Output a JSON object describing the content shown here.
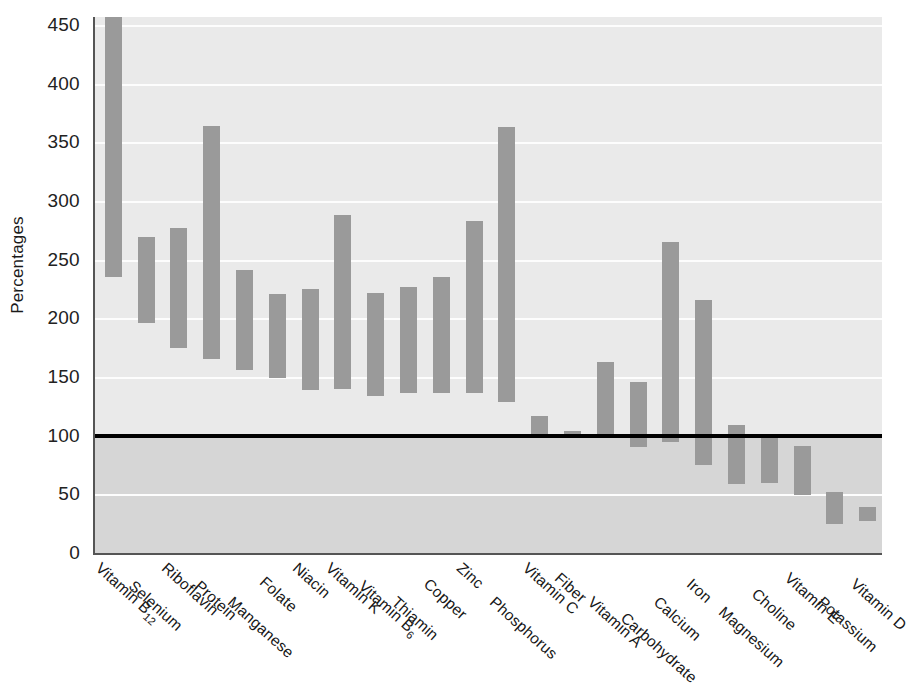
{
  "chart_data": {
    "type": "bar",
    "subtype": "floating-range-bar",
    "title": "",
    "xlabel": "",
    "ylabel": "Percentages",
    "ylim": [
      0,
      450
    ],
    "ytick_step": 50,
    "yticks": [
      0,
      50,
      100,
      150,
      200,
      250,
      300,
      350,
      400,
      450
    ],
    "ytick_labels": [
      "0",
      "50",
      "100",
      "150",
      "200",
      "250",
      "300",
      "350",
      "400",
      "450"
    ],
    "grid": true,
    "legend": "none",
    "reference_line": {
      "value": 100,
      "label": "100%",
      "color": "#000000"
    },
    "bar_color": "#9a9a9a",
    "plot_background": "#eaeaea",
    "lower_band_background": "#d6d6d6",
    "categories": [
      "Vitamin B12",
      "Selenium",
      "Riboflavin",
      "Protein",
      "Manganese",
      "Folate",
      "Niacin",
      "Vitamin K",
      "Vitamin B6",
      "Thiamin",
      "Copper",
      "Zinc",
      "Phosphorus",
      "Vitamin C",
      "Fiber",
      "Vitamin A",
      "Carbohydrate",
      "Calcium",
      "Iron",
      "Magnesium",
      "Choline",
      "Vitamin E",
      "Potassium",
      "Vitamin D"
    ],
    "category_labels": [
      {
        "base": "Vitamin B",
        "sub": "12"
      },
      {
        "base": "Selenium",
        "sub": ""
      },
      {
        "base": "Riboflavin",
        "sub": ""
      },
      {
        "base": "Protein",
        "sub": ""
      },
      {
        "base": "Manganese",
        "sub": ""
      },
      {
        "base": "Folate",
        "sub": ""
      },
      {
        "base": "Niacin",
        "sub": ""
      },
      {
        "base": "Vitamin K",
        "sub": ""
      },
      {
        "base": "Vitamin B",
        "sub": "6"
      },
      {
        "base": "Thiamin",
        "sub": ""
      },
      {
        "base": "Copper",
        "sub": ""
      },
      {
        "base": "Zinc",
        "sub": ""
      },
      {
        "base": "Phosphorus",
        "sub": ""
      },
      {
        "base": "Vitamin C",
        "sub": ""
      },
      {
        "base": "Fiber",
        "sub": ""
      },
      {
        "base": "Vitamin A",
        "sub": ""
      },
      {
        "base": "Carbohydrate",
        "sub": ""
      },
      {
        "base": "Calcium",
        "sub": ""
      },
      {
        "base": "Iron",
        "sub": ""
      },
      {
        "base": "Magnesium",
        "sub": ""
      },
      {
        "base": "Choline",
        "sub": ""
      },
      {
        "base": "Vitamin E",
        "sub": ""
      },
      {
        "base": "Potassium",
        "sub": ""
      },
      {
        "base": "Vitamin D",
        "sub": ""
      }
    ],
    "series": [
      {
        "name": "high",
        "values": [
          460,
          269,
          277,
          364,
          241,
          221,
          225,
          288,
          222,
          227,
          235,
          283,
          363,
          117,
          104,
          163,
          146,
          265,
          216,
          109,
          100,
          91,
          52,
          39
        ]
      },
      {
        "name": "low",
        "values": [
          235,
          196,
          175,
          165,
          156,
          149,
          139,
          140,
          134,
          136,
          136,
          136,
          129,
          100,
          101,
          98,
          90,
          95,
          75,
          59,
          60,
          49,
          25,
          27
        ]
      }
    ],
    "bars": [
      {
        "category": "Vitamin B12",
        "low": 235,
        "high": 460,
        "clipped_top": true
      },
      {
        "category": "Selenium",
        "low": 196,
        "high": 269,
        "clipped_top": false
      },
      {
        "category": "Riboflavin",
        "low": 175,
        "high": 277,
        "clipped_top": false
      },
      {
        "category": "Protein",
        "low": 165,
        "high": 364,
        "clipped_top": false
      },
      {
        "category": "Manganese",
        "low": 156,
        "high": 241,
        "clipped_top": false
      },
      {
        "category": "Folate",
        "low": 149,
        "high": 221,
        "clipped_top": false
      },
      {
        "category": "Niacin",
        "low": 139,
        "high": 225,
        "clipped_top": false
      },
      {
        "category": "Vitamin K",
        "low": 140,
        "high": 288,
        "clipped_top": false
      },
      {
        "category": "Vitamin B6",
        "low": 134,
        "high": 222,
        "clipped_top": false
      },
      {
        "category": "Thiamin",
        "low": 136,
        "high": 227,
        "clipped_top": false
      },
      {
        "category": "Copper",
        "low": 136,
        "high": 235,
        "clipped_top": false
      },
      {
        "category": "Zinc",
        "low": 136,
        "high": 283,
        "clipped_top": false
      },
      {
        "category": "Phosphorus",
        "low": 129,
        "high": 363,
        "clipped_top": false
      },
      {
        "category": "Vitamin C",
        "low": 100,
        "high": 117,
        "clipped_top": false
      },
      {
        "category": "Fiber",
        "low": 101,
        "high": 104,
        "clipped_top": false
      },
      {
        "category": "Vitamin A",
        "low": 98,
        "high": 163,
        "clipped_top": false
      },
      {
        "category": "Carbohydrate",
        "low": 90,
        "high": 146,
        "clipped_top": false
      },
      {
        "category": "Calcium",
        "low": 95,
        "high": 265,
        "clipped_top": false
      },
      {
        "category": "Iron",
        "low": 75,
        "high": 216,
        "clipped_top": false
      },
      {
        "category": "Magnesium",
        "low": 59,
        "high": 109,
        "clipped_top": false
      },
      {
        "category": "Choline",
        "low": 60,
        "high": 100,
        "clipped_top": false
      },
      {
        "category": "Vitamin E",
        "low": 49,
        "high": 91,
        "clipped_top": false
      },
      {
        "category": "Potassium",
        "low": 25,
        "high": 52,
        "clipped_top": false
      },
      {
        "category": "Vitamin D",
        "low": 27,
        "high": 39,
        "clipped_top": false
      }
    ]
  },
  "axis": {
    "y_title": "Percentages"
  }
}
